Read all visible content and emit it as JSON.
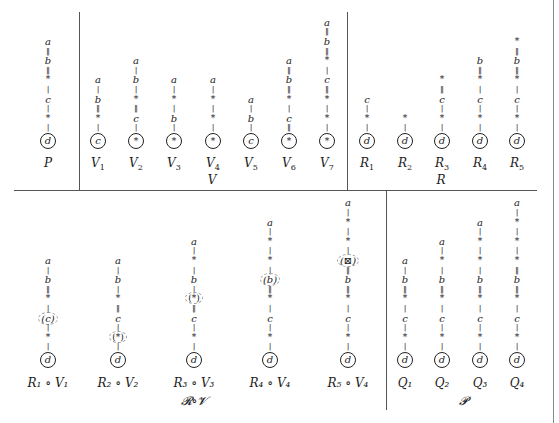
{
  "header": {
    "text": ""
  },
  "top_panels": [
    {
      "group": "",
      "items": [
        {
          "name": "P",
          "sub": "",
          "x": 48,
          "chain": [
            "a",
            "‖",
            "b",
            "‖",
            "*",
            "|",
            "c",
            "|",
            "*",
            "|"
          ],
          "root": "d"
        }
      ]
    },
    {
      "group": "V",
      "group_x": 212,
      "items": [
        {
          "name": "V",
          "sub": "1",
          "x": 98,
          "chain": [
            "a",
            "|",
            "b",
            "‖",
            "*",
            "|"
          ],
          "root": "c"
        },
        {
          "name": "V",
          "sub": "2",
          "x": 136,
          "chain": [
            "a",
            "|",
            "b",
            "|",
            "*",
            "‖",
            "c",
            "|"
          ],
          "root": "*"
        },
        {
          "name": "V",
          "sub": "3",
          "x": 174,
          "chain": [
            "a",
            "|",
            "*",
            "|",
            "b",
            "|"
          ],
          "root": "*"
        },
        {
          "name": "V",
          "sub": "4",
          "x": 213,
          "chain": [
            "a",
            "|",
            "*",
            "|",
            "*",
            "|"
          ],
          "root": "*"
        },
        {
          "name": "V",
          "sub": "5",
          "x": 251,
          "chain": [
            "a",
            "|",
            "b",
            "|"
          ],
          "root": "c"
        },
        {
          "name": "V",
          "sub": "6",
          "x": 289,
          "chain": [
            "a",
            "‖",
            "b",
            "‖",
            "*",
            "|",
            "c",
            "‖"
          ],
          "root": "*"
        },
        {
          "name": "V",
          "sub": "7",
          "x": 327,
          "chain": [
            "a",
            "‖",
            "b",
            "‖",
            "*",
            "|",
            "c",
            "‖",
            "*",
            "|",
            "*",
            "|"
          ],
          "root": "*"
        }
      ]
    },
    {
      "group": "R",
      "group_x": 441,
      "items": [
        {
          "name": "R",
          "sub": "1",
          "x": 367,
          "chain": [
            "c",
            "|",
            "*",
            "|"
          ],
          "root": "d"
        },
        {
          "name": "R",
          "sub": "2",
          "x": 405,
          "chain": [
            "*",
            "|"
          ],
          "root": "d"
        },
        {
          "name": "R",
          "sub": "3",
          "x": 442,
          "chain": [
            "*",
            "‖",
            "c",
            "|",
            "*",
            "|"
          ],
          "root": "d"
        },
        {
          "name": "R",
          "sub": "4",
          "x": 480,
          "chain": [
            "b",
            "‖",
            "*",
            "|",
            "c",
            "|",
            "*",
            "|"
          ],
          "root": "d"
        },
        {
          "name": "R",
          "sub": "5",
          "x": 517,
          "chain": [
            "*",
            "‖",
            "b",
            "‖",
            "*",
            "|",
            "c",
            "|",
            "*",
            "|"
          ],
          "root": "d"
        }
      ]
    }
  ],
  "bottom_panels": [
    {
      "group": "𝓡∘𝓥",
      "group_x": 194,
      "items": [
        {
          "name": "R₁ ∘ V₁",
          "x": 48,
          "chain": [
            "a",
            "|",
            "b",
            "‖",
            "*",
            "|",
            "(c)",
            "|",
            "*",
            "|"
          ],
          "root": "d"
        },
        {
          "name": "R₂ ∘ V₂",
          "x": 118,
          "chain": [
            "a",
            "|",
            "b",
            "|",
            "*",
            "‖",
            "c",
            "|",
            "(*)",
            "|"
          ],
          "root": "d"
        },
        {
          "name": "R₃ ∘ V₃",
          "x": 194,
          "chain": [
            "a",
            "|",
            "*",
            "|",
            "b",
            "|",
            "(*)",
            "‖",
            "c",
            "|",
            "*",
            "|"
          ],
          "root": "d"
        },
        {
          "name": "R₄ ∘ V₄",
          "x": 270,
          "chain": [
            "a",
            "|",
            "*",
            "|",
            "*",
            "|",
            "(b)",
            "‖",
            "*",
            "|",
            "c",
            "|",
            "*",
            "|"
          ],
          "root": "d"
        },
        {
          "name": "R₅ ∘ V₄",
          "x": 348,
          "chain": [
            "a",
            "|",
            "*",
            "|",
            "*",
            "|",
            "(⊠)",
            "‖",
            "b",
            "‖",
            "*",
            "|",
            "c",
            "|",
            "*",
            "|"
          ],
          "root": "d"
        }
      ]
    },
    {
      "group": "𝓟",
      "group_x": 463,
      "items": [
        {
          "name": "Q₁",
          "x": 405,
          "chain": [
            "a",
            "|",
            "b",
            "‖",
            "*",
            "|",
            "c",
            "|",
            "*",
            "|"
          ],
          "root": "d"
        },
        {
          "name": "Q₂",
          "x": 442,
          "chain": [
            "a",
            "|",
            "*",
            "|",
            "b",
            "‖",
            "*",
            "|",
            "c",
            "|",
            "*",
            "|"
          ],
          "root": "d"
        },
        {
          "name": "Q₃",
          "x": 480,
          "chain": [
            "a",
            "|",
            "*",
            "|",
            "*",
            "|",
            "b",
            "‖",
            "*",
            "|",
            "c",
            "|",
            "*",
            "|"
          ],
          "root": "d"
        },
        {
          "name": "Q₄",
          "x": 517,
          "chain": [
            "a",
            "|",
            "*",
            "|",
            "*",
            "|",
            "*",
            "‖",
            "b",
            "‖",
            "*",
            "|",
            "c",
            "|",
            "*",
            "|"
          ],
          "root": "d"
        }
      ]
    }
  ]
}
